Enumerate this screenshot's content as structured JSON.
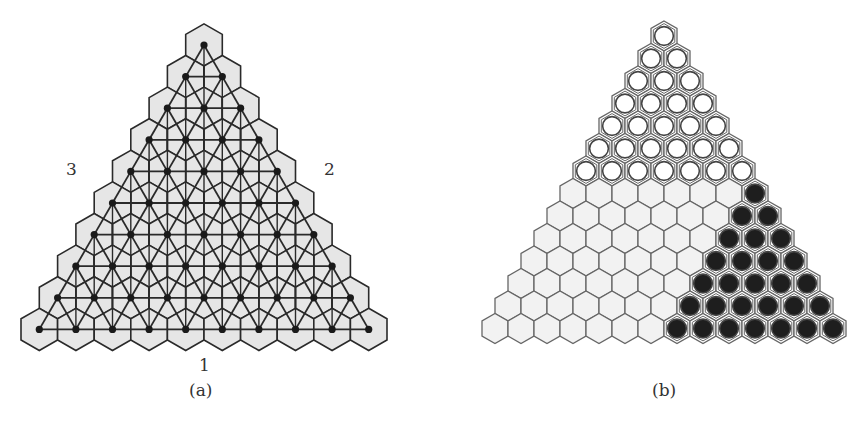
{
  "figure_a": {
    "caption": "(a)",
    "side_labels": {
      "bottom": "1",
      "right": "2",
      "left": "3"
    },
    "rows": 10,
    "apex": [
      204,
      45
    ],
    "step_x": 36.6,
    "step_y": 31.6,
    "hex_fill": "#e6e6e6",
    "line_color": "#2a2a2a"
  },
  "figure_b": {
    "caption": "(b)",
    "rows": 14,
    "apex": [
      664,
      36
    ],
    "step_x": 26,
    "step_y": 22.5,
    "white_stone_rows": 7,
    "description": "Rows 0-6 filled with white stones; rows 7-13 empty on the left with black stones filling the rightmost (row-6) cells",
    "empty_fill": "#f2f2f2",
    "stone_black": "#1e1e1e",
    "stone_white": "#ffffff",
    "edge_color": "#666666"
  }
}
